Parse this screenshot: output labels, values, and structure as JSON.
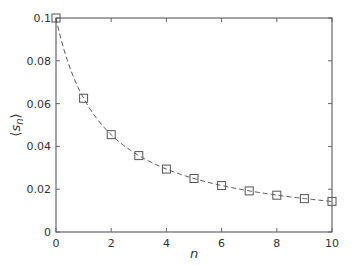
{
  "chart_data": {
    "type": "line",
    "title": "",
    "xlabel": "n",
    "ylabel": "⟨s_n⟩",
    "ylabel_display": {
      "open": "⟨",
      "main": "s",
      "sub": "n",
      "close": "⟩"
    },
    "xlim": [
      0,
      10
    ],
    "ylim": [
      0,
      0.1
    ],
    "xticks": [
      0,
      2,
      4,
      6,
      8,
      10
    ],
    "xtick_labels": [
      "0",
      "2",
      "4",
      "6",
      "8",
      "10"
    ],
    "yticks": [
      0,
      0.02,
      0.04,
      0.06,
      0.08,
      0.1
    ],
    "ytick_labels": [
      "0",
      "0.02",
      "0.04",
      "0.06",
      "0.08",
      "0.1"
    ],
    "grid": false,
    "legend": null,
    "series": [
      {
        "name": "simulation",
        "style": "square-markers",
        "color": "#555555",
        "x": [
          0,
          1,
          2,
          3,
          4,
          5,
          6,
          7,
          8,
          9,
          10
        ],
        "values": [
          0.1,
          0.0625,
          0.0455,
          0.0357,
          0.0294,
          0.025,
          0.0217,
          0.0192,
          0.0172,
          0.0156,
          0.0143
        ]
      },
      {
        "name": "theory",
        "style": "dashed-line",
        "color": "#555555",
        "function": "1/(10+6n)"
      }
    ]
  }
}
